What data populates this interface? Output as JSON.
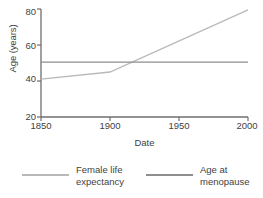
{
  "chart_data": {
    "type": "line",
    "title": "",
    "xlabel": "Date",
    "ylabel": "Age (years)",
    "xlim": [
      1850,
      2000
    ],
    "ylim": [
      20,
      80
    ],
    "xticks": [
      1850,
      1900,
      1950,
      2000
    ],
    "yticks": [
      20,
      40,
      60,
      80
    ],
    "xtick_labels": [
      "1850",
      "1900",
      "1950",
      "2000"
    ],
    "ytick_labels": [
      "20",
      "40",
      "60",
      "80"
    ],
    "grid": false,
    "legend_position": "bottom",
    "series": [
      {
        "name": "Female life expectancy",
        "color": "#b9b9b9",
        "x": [
          1850,
          1900,
          2000
        ],
        "y": [
          41,
          45,
          79.5
        ]
      },
      {
        "name": "Age at menopause",
        "color": "#8e8e8e",
        "x": [
          1850,
          2000
        ],
        "y": [
          50.5,
          50.5
        ]
      }
    ]
  },
  "legend": {
    "entries": [
      {
        "line1": "Female life",
        "line2": "expectancy"
      },
      {
        "line1": "Age at",
        "line2": "menopause"
      }
    ]
  },
  "axes": {
    "color": "#6e6e6e",
    "background": "#ffffff"
  }
}
